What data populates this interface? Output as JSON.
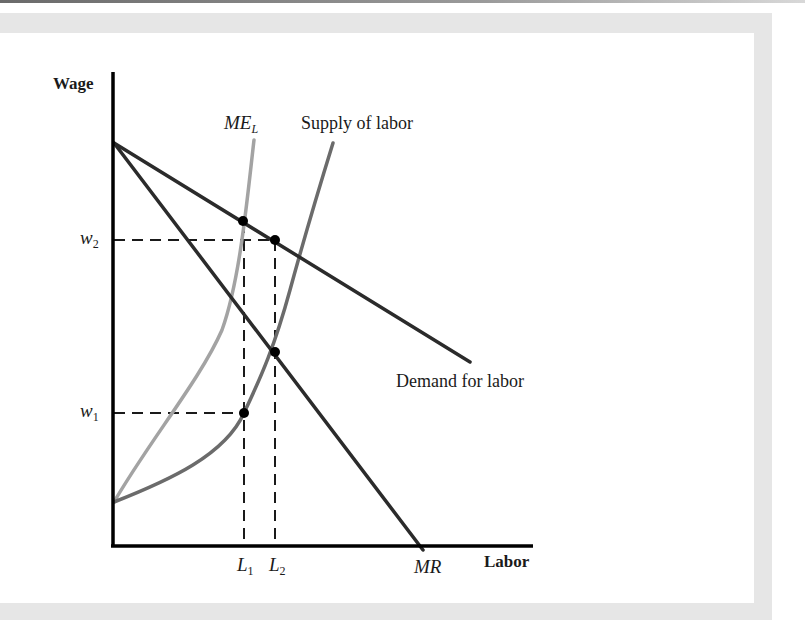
{
  "diagram": {
    "axes": {
      "y_label": "Wage",
      "x_label": "Labor"
    },
    "curves": {
      "me_l": {
        "label_main": "ME",
        "label_sub": "L",
        "color": "#a3a3a3"
      },
      "supply": {
        "label": "Supply of labor",
        "color": "#6b6b6b"
      },
      "demand": {
        "label": "Demand for labor",
        "color": "#2b2b2b"
      },
      "mr": {
        "label": "MR",
        "color": "#2b2b2b"
      }
    },
    "y_ticks": [
      {
        "main": "w",
        "sub": "2"
      },
      {
        "main": "w",
        "sub": "1"
      }
    ],
    "x_ticks": [
      {
        "main": "L",
        "sub": "1"
      },
      {
        "main": "L",
        "sub": "2"
      }
    ],
    "points": [
      {
        "name": "ME_L meets demand",
        "x_level": "L1"
      },
      {
        "name": "Demand at w2",
        "x_level": "L2",
        "y_level": "w2"
      },
      {
        "name": "Supply meets MR",
        "x_level": "L2"
      },
      {
        "name": "Supply at w1",
        "x_level": "L1",
        "y_level": "w1"
      }
    ]
  }
}
